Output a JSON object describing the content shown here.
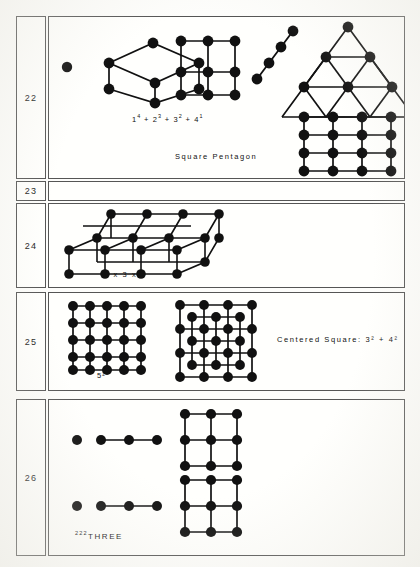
{
  "page": {
    "background": "#fdfdfb",
    "ink": "#111111",
    "rule_color": "#555555"
  },
  "rows": [
    {
      "number": "22",
      "labels": [
        {
          "name": "sum-formula",
          "text": "1⁴ + 2³ + 3² + 4¹",
          "parts": [
            "1",
            "4",
            "+ 2",
            "3",
            "+ 3",
            "2",
            "+ 4",
            "1"
          ]
        },
        {
          "name": "square-pentagon-caption",
          "text": "Square  Pentagon"
        }
      ],
      "figures": [
        {
          "name": "single-dot",
          "type": "dots",
          "dots": 1
        },
        {
          "name": "cube-graph",
          "type": "cube",
          "dots": 7
        },
        {
          "name": "square-grid-3x3",
          "type": "grid",
          "cols": 3,
          "rows": 3,
          "dots": 9
        },
        {
          "name": "diagonal-chain-4",
          "type": "chain",
          "dots": 4
        },
        {
          "name": "pentagon-house",
          "type": "house",
          "triangle_rows": 4,
          "square_cols": 4,
          "square_rows": 4
        }
      ]
    },
    {
      "number": "23",
      "labels": [],
      "figures": []
    },
    {
      "number": "24",
      "labels": [
        {
          "name": "box-dimensions",
          "text": "2  x  3  x  4"
        }
      ],
      "figures": [
        {
          "name": "lattice-box-3d",
          "type": "box3d",
          "dims": [
            2,
            3,
            4
          ]
        }
      ]
    },
    {
      "number": "25",
      "labels": [
        {
          "name": "five-squared",
          "text": "5²"
        },
        {
          "name": "centered-square-formula",
          "text": "Centered Square:  3² + 4²"
        }
      ],
      "figures": [
        {
          "name": "square-grid-5x5",
          "type": "grid",
          "cols": 5,
          "rows": 5,
          "dots": 25
        },
        {
          "name": "centered-square-figure",
          "type": "centered-square",
          "outer": 4,
          "inner": 3
        }
      ]
    },
    {
      "number": "26",
      "labels": [
        {
          "name": "three-caption",
          "exponents": "222",
          "text": "THREE"
        }
      ],
      "figures": [
        {
          "name": "dot-and-triple-top",
          "type": "dot-plus-line",
          "dots": 4
        },
        {
          "name": "dot-and-triple-bottom",
          "type": "dot-plus-line",
          "dots": 4
        },
        {
          "name": "grid-3x3-upper",
          "type": "grid",
          "cols": 3,
          "rows": 3,
          "dots": 9
        },
        {
          "name": "grid-3x3-lower",
          "type": "grid",
          "cols": 3,
          "rows": 3,
          "dots": 9
        }
      ]
    }
  ]
}
